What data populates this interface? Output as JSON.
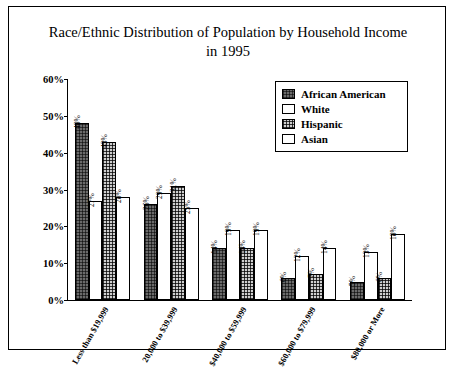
{
  "chart_data": {
    "type": "bar",
    "title": "Race/Ethnic Distribution of Population by Household Income in 1995",
    "title_line1": "Race/Ethnic Distribution of Population by Household Income",
    "title_line2": "in 1995",
    "xlabel": "",
    "ylabel": "",
    "ylim": [
      0,
      60
    ],
    "ytick_labels": [
      "0%",
      "10%",
      "20%",
      "30%",
      "40%",
      "50%",
      "60%"
    ],
    "ytick_values": [
      0,
      10,
      20,
      30,
      40,
      50,
      60
    ],
    "grid": false,
    "legend_position": "top-right",
    "categories": [
      "Less than $19,999",
      "20,000 to $39,999",
      "$40,000 to $59,999",
      "$60,000 to $79,999",
      "$80,000 or More"
    ],
    "series": [
      {
        "name": "African American",
        "color": "#6b6b6b",
        "values": [
          48,
          26,
          14,
          6,
          5
        ],
        "labels": [
          "48%",
          "26%",
          "14%",
          "6%",
          "5%"
        ]
      },
      {
        "name": "White",
        "color": "#ffffff",
        "values": [
          27,
          29,
          19,
          12,
          13
        ],
        "labels": [
          "27%",
          "29%",
          "19%",
          "12%",
          "13%"
        ]
      },
      {
        "name": "Hispanic",
        "color": "#cfcfcf",
        "values": [
          43,
          31,
          14,
          7,
          6
        ],
        "labels": [
          "43%",
          "31%",
          "14%",
          "7%",
          "6%"
        ]
      },
      {
        "name": "Asian",
        "color": "#ffffff",
        "values": [
          28,
          25,
          19,
          14,
          18
        ],
        "labels": [
          "28%",
          "25%",
          "19%",
          "14%",
          "18%"
        ]
      }
    ]
  }
}
